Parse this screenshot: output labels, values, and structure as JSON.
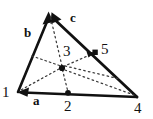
{
  "figure": {
    "type": "triangle-mesh-diagram",
    "background_color": "#ffffff",
    "stroke_color": "#111111",
    "dotted_color": "#444444",
    "width": 153,
    "height": 119,
    "vertices": [
      {
        "id": "1",
        "label": "1",
        "x": 18,
        "y": 92,
        "label_x": 3,
        "label_y": 92
      },
      {
        "id": "apex",
        "label": "",
        "x": 50,
        "y": 13,
        "label_x": 50,
        "label_y": 13
      },
      {
        "id": "4",
        "label": "4",
        "x": 137,
        "y": 97,
        "label_x": 136,
        "label_y": 101
      }
    ],
    "midpoints": [
      {
        "id": "2",
        "label": "2",
        "x": 68,
        "y": 93,
        "label_x": 64,
        "label_y": 99
      },
      {
        "id": "5",
        "label": "5",
        "x": 95,
        "y": 53,
        "label_x": 101,
        "label_y": 43
      },
      {
        "id": "3",
        "label": "3",
        "x": 62,
        "y": 68,
        "label_x": 63,
        "label_y": 45
      }
    ],
    "edge_labels": [
      {
        "id": "a",
        "label": "a",
        "x": 35,
        "y": 98
      },
      {
        "id": "b",
        "label": "b",
        "x": 26,
        "y": 25
      },
      {
        "id": "c",
        "label": "c",
        "x": 71,
        "y": 10
      }
    ],
    "solid_edges": [
      {
        "name": "edge-a",
        "from": "4",
        "to": "1",
        "arrow": "to"
      },
      {
        "name": "edge-b",
        "from": "1",
        "to": "apex",
        "arrow": "to"
      },
      {
        "name": "edge-c",
        "from": "4",
        "to": "apex",
        "arrow": "to"
      }
    ],
    "dotted_edges": [
      {
        "name": "dotted-center-to-apex",
        "from": "3",
        "to": "apex"
      },
      {
        "name": "dotted-center-to-node5",
        "from": "3",
        "to": "5",
        "arrow": "to"
      },
      {
        "name": "dotted-center-to-node2",
        "from": "3",
        "to": "2"
      },
      {
        "name": "dotted-center-to-vertex1",
        "from": "3",
        "to": "1"
      },
      {
        "name": "dotted-center-to-vertex4",
        "from": "3",
        "to": "4"
      },
      {
        "name": "dotted-center-to-upper-left",
        "from": "3",
        "to": "upper-left"
      },
      {
        "name": "dotted-center-to-lower-right",
        "from": "3",
        "to": "lower-right"
      }
    ]
  }
}
